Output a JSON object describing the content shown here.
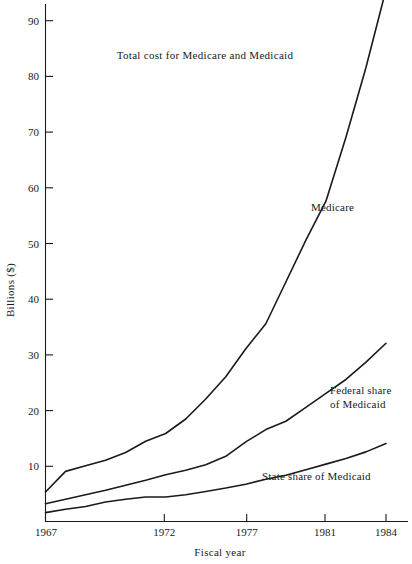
{
  "chart_data": {
    "type": "line",
    "title": "Total cost for Medicare and Medicaid",
    "xlabel": "Fiscal year",
    "ylabel": "Billions ($)",
    "xlim": [
      1967,
      1984
    ],
    "ylim": [
      0,
      96
    ],
    "grid": false,
    "legend_position": "inline-annotations",
    "xticks": [
      1967,
      1972,
      1977,
      1981,
      1984
    ],
    "xtick_labels": [
      "1967",
      "1972",
      "1977",
      "1981",
      "1984"
    ],
    "yticks": [
      10,
      20,
      30,
      40,
      50,
      60,
      70,
      80,
      90
    ],
    "ytick_labels": [
      "10",
      "20",
      "30",
      "40",
      "50",
      "60",
      "70",
      "80",
      "90"
    ],
    "x": [
      1967,
      1968,
      1969,
      1970,
      1971,
      1972,
      1973,
      1974,
      1975,
      1976,
      1977,
      1978,
      1979,
      1980,
      1981,
      1982,
      1983,
      1984
    ],
    "series": [
      {
        "name": "Medicare",
        "label": "Medicare",
        "color": "#1a1a1a",
        "values": [
          5.3,
          9.0,
          10.0,
          11.0,
          12.4,
          14.4,
          15.8,
          18.4,
          22.0,
          26.0,
          31.0,
          35.5,
          43.0,
          50.5,
          57.5,
          69.0,
          81.5,
          95.5
        ]
      },
      {
        "name": "Federal share of Medicaid",
        "label": "Federal share\nof Medicaid",
        "label_line1": "Federal share",
        "label_line2": "of Medicaid",
        "color": "#1a1a1a",
        "values": [
          3.2,
          4.0,
          4.8,
          5.6,
          6.5,
          7.4,
          8.4,
          9.2,
          10.2,
          11.7,
          14.3,
          16.5,
          18.0,
          20.5,
          23.0,
          25.5,
          28.6,
          32.0
        ]
      },
      {
        "name": "State share of Medicaid",
        "label": "State share of Medicaid",
        "color": "#1a1a1a",
        "values": [
          1.6,
          2.2,
          2.7,
          3.5,
          4.0,
          4.4,
          4.4,
          4.8,
          5.4,
          6.0,
          6.7,
          7.6,
          8.3,
          9.3,
          10.3,
          11.3,
          12.5,
          14.0
        ]
      }
    ],
    "annotations": [
      {
        "name": "medicare-annotation",
        "text": "Medicare",
        "x": 1980.2,
        "y": 57.5
      },
      {
        "name": "federal-share-annotation-line1",
        "text": "Federal share",
        "x": 1980.0,
        "y": 24.0
      },
      {
        "name": "federal-share-annotation-line2",
        "text": "of Medicaid",
        "x": 1980.0,
        "y": 21.5
      },
      {
        "name": "state-share-annotation",
        "text": "State share of Medicaid",
        "x": 1977.2,
        "y": 8.6
      }
    ]
  },
  "figure": {
    "background_color": "#ffffff",
    "axis_color": "#1a1a1a",
    "line_color": "#1a1a1a"
  }
}
